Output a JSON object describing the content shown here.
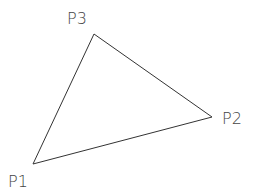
{
  "diagram": {
    "type": "triangle",
    "stroke_color": "#333333",
    "label_color": "#444444",
    "background": "#ffffff",
    "points": [
      {
        "id": "P1",
        "label": "P1",
        "x": 33,
        "y": 164,
        "label_x": 8,
        "label_y": 187
      },
      {
        "id": "P2",
        "label": "P2",
        "x": 212,
        "y": 117,
        "label_x": 222,
        "label_y": 124
      },
      {
        "id": "P3",
        "label": "P3",
        "x": 94,
        "y": 34,
        "label_x": 67,
        "label_y": 24
      }
    ],
    "edges": [
      {
        "from": "P1",
        "to": "P2"
      },
      {
        "from": "P2",
        "to": "P3"
      },
      {
        "from": "P3",
        "to": "P1"
      }
    ]
  }
}
